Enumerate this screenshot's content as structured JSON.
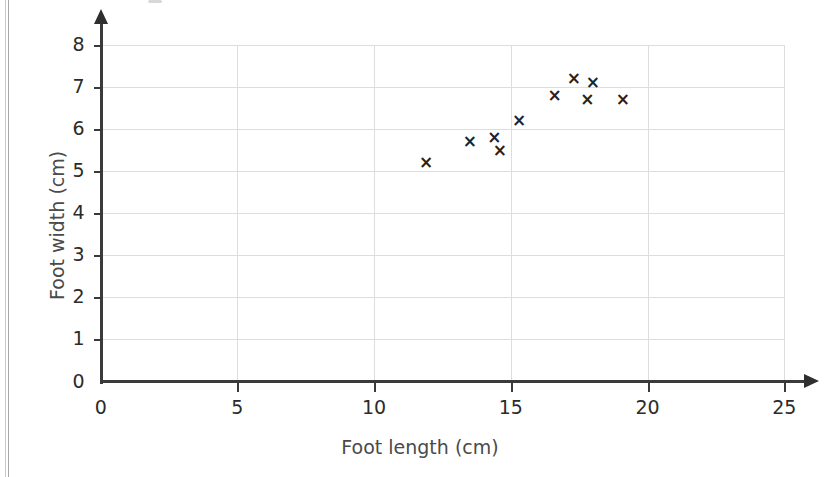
{
  "chart_data": {
    "type": "scatter",
    "title": "",
    "xlabel": "Foot length (cm)",
    "ylabel": "Foot width (cm)",
    "xlim": [
      0,
      25
    ],
    "ylim": [
      0,
      8
    ],
    "xticks": [
      0,
      5,
      10,
      15,
      20,
      25
    ],
    "yticks": [
      0,
      1,
      2,
      3,
      4,
      5,
      6,
      7,
      8
    ],
    "xtick_labels": [
      "0",
      "5",
      "10",
      "15",
      "20",
      "25"
    ],
    "ytick_labels": [
      "0",
      "1",
      "2",
      "3",
      "4",
      "5",
      "6",
      "7",
      "8"
    ],
    "grid": true,
    "grid_color": "#dddddd",
    "axis_color": "#3a3a3a",
    "marker": "x",
    "marker_color": "#232323",
    "legend": null,
    "points": [
      {
        "x": 11.9,
        "y": 5.2
      },
      {
        "x": 13.5,
        "y": 5.7
      },
      {
        "x": 14.4,
        "y": 5.8
      },
      {
        "x": 14.6,
        "y": 5.5
      },
      {
        "x": 15.3,
        "y": 6.2
      },
      {
        "x": 16.6,
        "y": 6.8
      },
      {
        "x": 17.3,
        "y": 7.2
      },
      {
        "x": 17.8,
        "y": 6.7
      },
      {
        "x": 18.0,
        "y": 7.1
      },
      {
        "x": 19.1,
        "y": 6.7
      }
    ]
  },
  "figure": {
    "background": "#ffffff",
    "xlabel_text": "Foot length (cm)",
    "ylabel_text": "Foot width (cm)"
  }
}
